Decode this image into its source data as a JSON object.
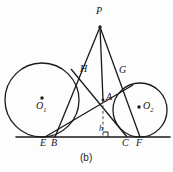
{
  "figure": {
    "caption": "(b)",
    "type": "geometry-diagram",
    "colors": {
      "stroke": "#1a1a1a",
      "background": "#fdfdfd",
      "label": "#141414"
    },
    "points": [
      {
        "name": "P",
        "label": "P",
        "x": 100,
        "y": 27,
        "label_x": 97,
        "label_y": 11
      },
      {
        "name": "H",
        "label": "H",
        "x": 79,
        "y": 76,
        "label_x": 81,
        "label_y": 65
      },
      {
        "name": "G",
        "label": "G",
        "x": 121,
        "y": 78,
        "label_x": 120,
        "label_y": 66
      },
      {
        "name": "A",
        "label": "A",
        "x": 103,
        "y": 100,
        "label_x": 106,
        "label_y": 93
      },
      {
        "name": "E",
        "label": "E",
        "x": 45,
        "y": 137,
        "label_x": 41,
        "label_y": 138
      },
      {
        "name": "B",
        "label": "B",
        "x": 55,
        "y": 137,
        "label_x": 52,
        "label_y": 138
      },
      {
        "name": "C",
        "label": "C",
        "x": 127,
        "y": 137,
        "label_x": 123,
        "label_y": 138
      },
      {
        "name": "F",
        "label": "F",
        "x": 140,
        "y": 137,
        "label_x": 137,
        "label_y": 138
      },
      {
        "name": "O1",
        "label": "O₁",
        "x": 42,
        "y": 100,
        "label_x": 35,
        "label_y": 104
      },
      {
        "name": "O2",
        "label": "O₂",
        "x": 140,
        "y": 110,
        "label_x": 145,
        "label_y": 103
      }
    ],
    "labels": {
      "P": "P",
      "H": "H",
      "G": "G",
      "A": "A",
      "E": "E",
      "B": "B",
      "C": "C",
      "F": "F",
      "O1_main": "O",
      "O1_sub": "1",
      "O2_main": "O",
      "O2_sub": "2",
      "h": "h"
    },
    "circles": [
      {
        "name": "left-circle",
        "cx": 42,
        "cy": 100,
        "r": 37
      },
      {
        "name": "right-circle",
        "cx": 140,
        "cy": 110,
        "r": 27
      }
    ],
    "baseline": {
      "x1": 16,
      "y1": 137,
      "x2": 170,
      "y2": 137
    },
    "dashed_segment": {
      "name": "altitude-h",
      "x1": 103,
      "y1": 100,
      "x2": 103,
      "y2": 137
    },
    "segments": [
      {
        "name": "P-to-B",
        "x1": 100,
        "y1": 27,
        "x2": 55,
        "y2": 137
      },
      {
        "name": "P-to-F",
        "x1": 100,
        "y1": 27,
        "x2": 140,
        "y2": 137
      },
      {
        "name": "P-to-A",
        "x1": 100,
        "y1": 27,
        "x2": 103,
        "y2": 100
      },
      {
        "name": "E-to-G",
        "x1": 45,
        "y1": 137,
        "x2": 131,
        "y2": 86
      },
      {
        "name": "C-to-H",
        "x1": 127,
        "y1": 137,
        "x2": 72,
        "y2": 70
      }
    ]
  }
}
